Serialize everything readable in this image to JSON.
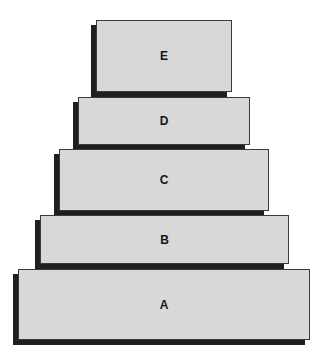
{
  "diagram": {
    "type": "stacked-pyramid",
    "colors": {
      "fill": "#d8d8d8",
      "border": "#3a3a3a",
      "shadow": "#1f1f1f",
      "text": "#151515"
    },
    "tiers": [
      {
        "label": "E",
        "x": 96,
        "y": 20,
        "w": 136,
        "h": 72
      },
      {
        "label": "D",
        "x": 78,
        "y": 97,
        "w": 172,
        "h": 48
      },
      {
        "label": "C",
        "x": 59,
        "y": 149,
        "w": 210,
        "h": 62
      },
      {
        "label": "B",
        "x": 40,
        "y": 215,
        "w": 249,
        "h": 49
      },
      {
        "label": "A",
        "x": 18,
        "y": 269,
        "w": 292,
        "h": 71
      }
    ]
  }
}
